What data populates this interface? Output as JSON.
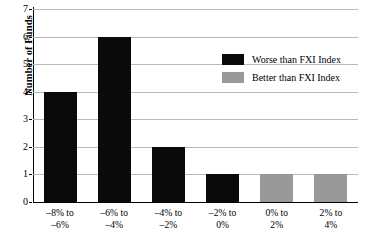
{
  "chart_data": {
    "type": "bar",
    "title": "",
    "xlabel": "",
    "ylabel": "Number of Funds",
    "categories": [
      "–8% to –6%",
      "–6% to –4%",
      "–4% to –2%",
      "–2% to 0%",
      "0% to 2%",
      "2% to 4%"
    ],
    "category_lines": [
      [
        "–8% to",
        "–6%"
      ],
      [
        "–6% to",
        "–4%"
      ],
      [
        "–4% to",
        "–2%"
      ],
      [
        "–2% to",
        "0%"
      ],
      [
        "0% to",
        "2%"
      ],
      [
        "2% to",
        "4%"
      ]
    ],
    "values": [
      4,
      6,
      2,
      1,
      1,
      1
    ],
    "bar_groups": [
      "worse",
      "worse",
      "worse",
      "worse",
      "better",
      "better"
    ],
    "ylim": [
      0,
      7
    ],
    "yticks": [
      "0",
      "1",
      "2",
      "3",
      "4",
      "5",
      "6",
      "7"
    ],
    "grid": true,
    "legend_position": "upper-right-inside",
    "legend": [
      {
        "key": "worse",
        "label": "Worse than FXI Index",
        "color": "#0a0a0a"
      },
      {
        "key": "better",
        "label": "Better than FXI Index",
        "color": "#999999"
      }
    ],
    "colors": {
      "worse": "#0a0a0a",
      "better": "#999999",
      "gridline": "#b8b8b8",
      "axis": "#000000",
      "background": "#ffffff"
    }
  }
}
